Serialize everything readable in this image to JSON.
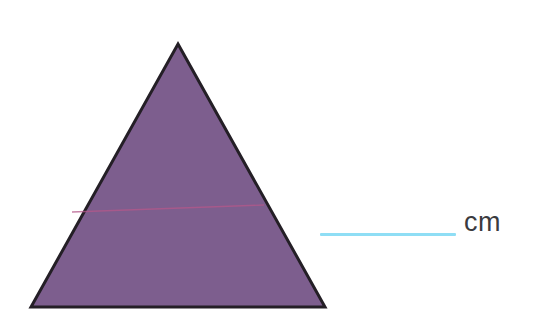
{
  "page": {
    "background_color": "#ffffff",
    "width": 542,
    "height": 327
  },
  "figure": {
    "shape_name": "triangle",
    "fill_color": "#7d5e8e",
    "outline_color": "#241f26",
    "outline_width": 3,
    "apex": {
      "x": 178,
      "y": 44
    },
    "bottom_left": {
      "x": 31,
      "y": 307
    },
    "bottom_right": {
      "x": 325,
      "y": 307
    },
    "crease_line": {
      "name": "pink-crease-line",
      "color": "#b5588a",
      "width": 1.4,
      "x1": 72,
      "y1": 212,
      "x2": 264,
      "y2": 205
    }
  },
  "answer": {
    "blank_line_color": "#8fdef5",
    "unit_label": "cm",
    "unit_label_color": "#3b3b3f",
    "value": ""
  }
}
